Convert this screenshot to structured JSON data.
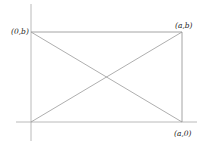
{
  "diagram": {
    "type": "rectangle-with-diagonals",
    "labels": {
      "top_left": "(0,b)",
      "top_right": "(a,b)",
      "bottom_right": "(a,0)"
    },
    "colors": {
      "line": "#9a9a9a",
      "axis": "#a8a8a8",
      "text": "#222222",
      "background": "#ffffff"
    }
  }
}
